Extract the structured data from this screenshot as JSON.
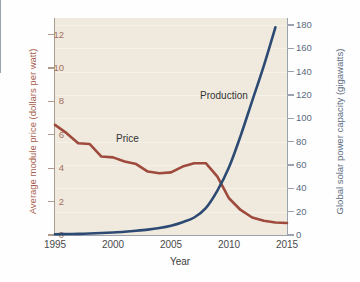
{
  "chart_data": {
    "type": "line",
    "title": "",
    "xlabel": "Year",
    "grid": true,
    "legend_position": "inline",
    "background_color": "#f0eade",
    "x": [
      1995,
      1996,
      1997,
      1998,
      1999,
      2000,
      2001,
      2002,
      2003,
      2004,
      2005,
      2006,
      2007,
      2008,
      2009,
      2010,
      2011,
      2012,
      2013,
      2014,
      2015
    ],
    "xlim": [
      1995,
      2015
    ],
    "xticks": [
      1995,
      2000,
      2005,
      2010,
      2015
    ],
    "xtick_labels": [
      "1995",
      "2000",
      "2005",
      "2010",
      "2015"
    ],
    "xminor_per_major": 4,
    "axes": [
      {
        "id": "left",
        "label": "Average module price (dollars per watt)",
        "color": "#a8604d",
        "lim": [
          0,
          13
        ],
        "ticks": [
          0,
          2,
          4,
          6,
          8,
          10,
          12
        ],
        "tick_labels": [
          "0",
          "2",
          "4",
          "6",
          "8",
          "10",
          "12"
        ]
      },
      {
        "id": "right",
        "label": "Global solar power capacity (gigawatts)",
        "color": "#5b6b80",
        "lim": [
          0,
          186
        ],
        "ticks": [
          0,
          20,
          40,
          60,
          80,
          100,
          120,
          140,
          160,
          180
        ],
        "tick_labels": [
          "0",
          "20",
          "40",
          "60",
          "80",
          "100",
          "120",
          "140",
          "160",
          "180"
        ]
      }
    ],
    "series": [
      {
        "name": "Price",
        "label": "Price",
        "axis": "left",
        "color": "#9e4a3c",
        "units": "dollars per watt",
        "values": [
          6.6,
          6.1,
          5.5,
          5.45,
          4.7,
          4.65,
          4.4,
          4.25,
          3.8,
          3.7,
          3.75,
          4.1,
          4.3,
          4.3,
          3.5,
          2.2,
          1.5,
          1.05,
          0.85,
          0.75,
          0.72
        ]
      },
      {
        "name": "Production",
        "label": "Production",
        "axis": "right",
        "color": "#2d4a73",
        "units": "gigawatts",
        "values": [
          0.6,
          0.8,
          1.0,
          1.3,
          1.7,
          2.2,
          2.8,
          3.6,
          4.6,
          6.0,
          8.0,
          11.0,
          15.0,
          23.0,
          38.0,
          58.0,
          85.0,
          115.0,
          145.0,
          178.0,
          null
        ]
      }
    ]
  }
}
